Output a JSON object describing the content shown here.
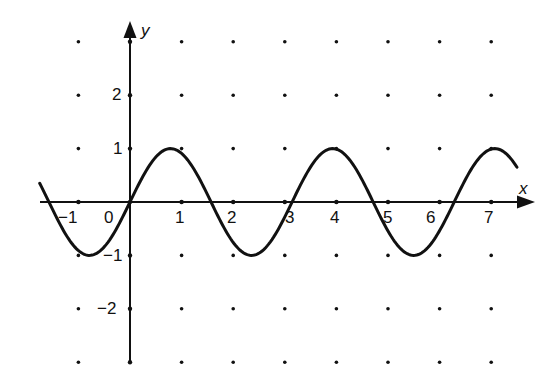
{
  "chart_data": {
    "type": "line",
    "title": "",
    "xlabel": "x",
    "ylabel": "y",
    "function": "y = sin(2x)",
    "xlim": [
      -1.75,
      7.5
    ],
    "ylim": [
      -3,
      3
    ],
    "grid": "dots",
    "x_ticks": [
      -1,
      0,
      1,
      2,
      3,
      4,
      5,
      6,
      7
    ],
    "x_tick_labels": [
      "−1",
      "0",
      "1",
      "2",
      "3",
      "4",
      "5",
      "6",
      "7"
    ],
    "y_ticks": [
      -2,
      -1,
      1,
      2
    ],
    "y_tick_labels": [
      "−2",
      "−1",
      "1",
      "2"
    ],
    "series": [
      {
        "name": "sin(2x)",
        "x": [
          -1.75,
          -1.5,
          -1.25,
          -1.0,
          -0.785,
          -0.5,
          -0.25,
          0,
          0.25,
          0.5,
          0.785,
          1.0,
          1.25,
          1.571,
          2.0,
          2.356,
          2.75,
          3.142,
          3.5,
          3.927,
          4.25,
          4.712,
          5.0,
          5.498,
          6.0,
          6.283,
          6.75,
          7.069,
          7.5
        ],
        "values": [
          0.35,
          -0.14,
          -0.6,
          -0.91,
          -1.0,
          -0.84,
          -0.48,
          0,
          0.48,
          0.84,
          1.0,
          0.91,
          0.6,
          0,
          -0.76,
          -1.0,
          -0.71,
          0,
          0.66,
          1.0,
          0.8,
          0,
          -0.54,
          -1.0,
          -0.54,
          0,
          0.8,
          1.0,
          0.65
        ]
      }
    ],
    "annotations": [
      "x",
      "y"
    ]
  },
  "labels": {
    "x_axis": "x",
    "y_axis": "y",
    "x_ticks": [
      "−1",
      "0",
      "1",
      "2",
      "3",
      "4",
      "5",
      "6",
      "7"
    ],
    "y_ticks": [
      "2",
      "1",
      "−1",
      "−2"
    ]
  }
}
